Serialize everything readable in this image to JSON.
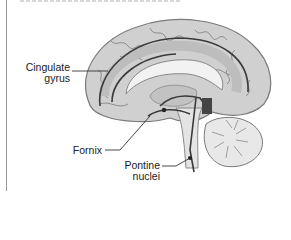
{
  "figure": {
    "header_text_cropped": "",
    "labels": {
      "cingulate_line1": "Cingulate",
      "cingulate_line2": "gyrus",
      "fornix": "Fornix",
      "pontine_line1": "Pontine",
      "pontine_line2": "nuclei"
    },
    "colors": {
      "background": "#ffffff",
      "cortex": "#d2d2d2",
      "cortex_shade": "#9e9e9e",
      "corpus_callosum": "#f2f2f2",
      "pathway": "#3a3a3a",
      "leader_line": "#333333"
    }
  }
}
